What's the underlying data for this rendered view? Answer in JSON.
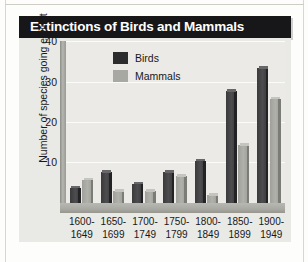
{
  "figure": {
    "title": "Extinctions of Birds and Mammals"
  },
  "legend": {
    "entries": [
      {
        "label": "Birds",
        "color": "#2c2c2e"
      },
      {
        "label": "Mammals",
        "color": "#a8a8a2"
      }
    ]
  },
  "axes": {
    "ylabel": "Number of species going extinct",
    "yticks": [
      "40",
      "30",
      "20",
      "10"
    ],
    "xticks": [
      {
        "line1": "1600-",
        "line2": "1649"
      },
      {
        "line1": "1650-",
        "line2": "1699"
      },
      {
        "line1": "1700-",
        "line2": "1749"
      },
      {
        "line1": "1750-",
        "line2": "1799"
      },
      {
        "line1": "1800-",
        "line2": "1849"
      },
      {
        "line1": "1850-",
        "line2": "1899"
      },
      {
        "line1": "1900-",
        "line2": "1949"
      }
    ]
  },
  "colors": {
    "title_bar": "#17171a",
    "title_text": "#ffffff",
    "plot_background": "#eceae6",
    "gridline": "#fbfbf9",
    "birds": "#3f3f42",
    "mammals": "#a8a8a2"
  },
  "chart_data": {
    "type": "bar",
    "title": "Extinctions of Birds and Mammals",
    "xlabel": "",
    "ylabel": "Number of species going extinct",
    "ylim": [
      0,
      42
    ],
    "yticks": [
      10,
      20,
      30,
      40
    ],
    "grid": true,
    "legend_position": "upper-center",
    "categories": [
      "1600-1649",
      "1650-1699",
      "1700-1749",
      "1750-1799",
      "1800-1849",
      "1850-1899",
      "1900-1949"
    ],
    "series": [
      {
        "name": "Birds",
        "values": [
          4,
          8,
          5,
          8,
          11,
          29,
          35
        ]
      },
      {
        "name": "Mammals",
        "values": [
          6,
          3,
          3,
          7,
          2,
          15,
          27
        ]
      }
    ]
  }
}
